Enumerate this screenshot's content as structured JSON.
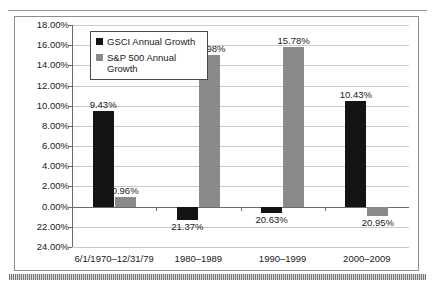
{
  "chart_data": {
    "type": "bar",
    "title": "",
    "xlabel": "",
    "ylabel": "",
    "grid": true,
    "legend_position": "top-left-inside",
    "ylim": [
      -4,
      18
    ],
    "ytick_labels": [
      "18.00%",
      "16.00%",
      "14.00%",
      "12.00%",
      "10.00%",
      "8.00%",
      "6.00%",
      "4.00%",
      "2.00%",
      "0.00%",
      "22.00%",
      "24.00%"
    ],
    "ytick_values": [
      18,
      16,
      14,
      12,
      10,
      8,
      6,
      4,
      2,
      0,
      -2,
      -4
    ],
    "categories": [
      "6/1/1970–12/31/79",
      "1980–1989",
      "1990–1999",
      "2000–2009"
    ],
    "series": [
      {
        "name": "GSCI Annual Growth",
        "color": "#141414",
        "values": [
          9.43,
          -1.37,
          -0.63,
          10.43
        ],
        "labels": [
          "9.43%",
          "21.37%",
          "20.63%",
          "10.43%"
        ]
      },
      {
        "name": "S&P 500 Annual Growth",
        "color": "#8a8a8a",
        "values": [
          0.96,
          14.98,
          15.78,
          -0.95
        ],
        "labels": [
          "0.96%",
          "14.98%",
          "15.78%",
          "20.95%"
        ]
      }
    ]
  },
  "legend": {
    "items": [
      {
        "label": "GSCI Annual Growth",
        "marker": "black-square-marker"
      },
      {
        "label": "S&P 500 Annual Growth",
        "marker": "gray-square-marker"
      }
    ]
  },
  "colors": {
    "gsci_bar": "#141414",
    "sp500_bar": "#8a8a8a",
    "gridline": "#c9c9c9",
    "axis": "#6a6a6a",
    "frame_border": "#8e8e8e"
  }
}
